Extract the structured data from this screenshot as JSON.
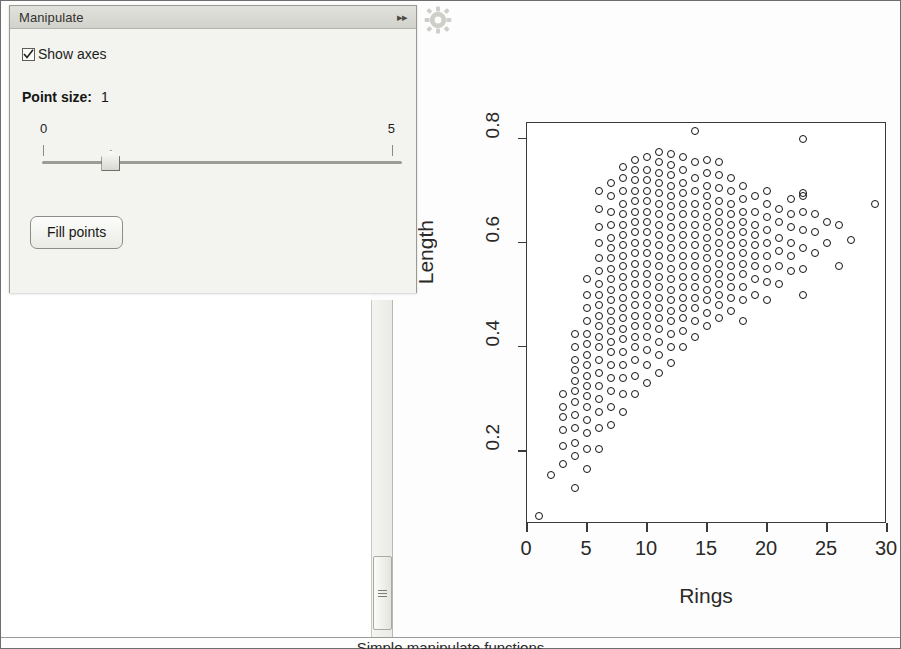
{
  "panel": {
    "title": "Manipulate",
    "collapse_icon": "chevron-double-right-icon",
    "checkbox": {
      "label": "Show axes",
      "checked": true
    },
    "point_size": {
      "label": "Point size:",
      "value": "1"
    },
    "slider": {
      "min_label": "0",
      "max_label": "5",
      "value": 0.95,
      "min": 0,
      "max": 5
    },
    "button": {
      "label": "Fill points"
    }
  },
  "toolbar": {
    "settings_icon": "gear-icon"
  },
  "scrollbar": {
    "name": "vertical-scrollbar",
    "thumb": "scrollbar-thumb"
  },
  "caption": {
    "text": "Simple manipulate functions"
  },
  "chart_data": {
    "type": "scatter",
    "title": "",
    "xlabel": "Rings",
    "ylabel": "Length",
    "xlim": [
      0,
      30
    ],
    "ylim": [
      0.06,
      0.83
    ],
    "xticks": [
      0,
      5,
      10,
      15,
      20,
      25,
      30
    ],
    "yticks": [
      0.2,
      0.4,
      0.6,
      0.8
    ],
    "grid": false,
    "legend": null,
    "marker": "open-circle",
    "marker_color": "#111111",
    "point_count_note": "abalone rings vs length",
    "points": [
      [
        1,
        0.075
      ],
      [
        2,
        0.155
      ],
      [
        3,
        0.175
      ],
      [
        3,
        0.21
      ],
      [
        3,
        0.24
      ],
      [
        3,
        0.265
      ],
      [
        3,
        0.285
      ],
      [
        3,
        0.31
      ],
      [
        4,
        0.13
      ],
      [
        4,
        0.19
      ],
      [
        4,
        0.215
      ],
      [
        4,
        0.245
      ],
      [
        4,
        0.27
      ],
      [
        4,
        0.295
      ],
      [
        4,
        0.315
      ],
      [
        4,
        0.335
      ],
      [
        4,
        0.355
      ],
      [
        4,
        0.375
      ],
      [
        4,
        0.4
      ],
      [
        4,
        0.425
      ],
      [
        5,
        0.165
      ],
      [
        5,
        0.205
      ],
      [
        5,
        0.235
      ],
      [
        5,
        0.26
      ],
      [
        5,
        0.285
      ],
      [
        5,
        0.305
      ],
      [
        5,
        0.325
      ],
      [
        5,
        0.345
      ],
      [
        5,
        0.365
      ],
      [
        5,
        0.385
      ],
      [
        5,
        0.405
      ],
      [
        5,
        0.425
      ],
      [
        5,
        0.45
      ],
      [
        5,
        0.475
      ],
      [
        5,
        0.5
      ],
      [
        5,
        0.53
      ],
      [
        6,
        0.205
      ],
      [
        6,
        0.245
      ],
      [
        6,
        0.275
      ],
      [
        6,
        0.3
      ],
      [
        6,
        0.325
      ],
      [
        6,
        0.35
      ],
      [
        6,
        0.375
      ],
      [
        6,
        0.4
      ],
      [
        6,
        0.42
      ],
      [
        6,
        0.44
      ],
      [
        6,
        0.46
      ],
      [
        6,
        0.48
      ],
      [
        6,
        0.5
      ],
      [
        6,
        0.52
      ],
      [
        6,
        0.545
      ],
      [
        6,
        0.57
      ],
      [
        6,
        0.6
      ],
      [
        6,
        0.63
      ],
      [
        6,
        0.665
      ],
      [
        6,
        0.7
      ],
      [
        7,
        0.25
      ],
      [
        7,
        0.285
      ],
      [
        7,
        0.315
      ],
      [
        7,
        0.34
      ],
      [
        7,
        0.365
      ],
      [
        7,
        0.39
      ],
      [
        7,
        0.41
      ],
      [
        7,
        0.43
      ],
      [
        7,
        0.45
      ],
      [
        7,
        0.47
      ],
      [
        7,
        0.49
      ],
      [
        7,
        0.51
      ],
      [
        7,
        0.53
      ],
      [
        7,
        0.55
      ],
      [
        7,
        0.57
      ],
      [
        7,
        0.59
      ],
      [
        7,
        0.61
      ],
      [
        7,
        0.635
      ],
      [
        7,
        0.66
      ],
      [
        7,
        0.69
      ],
      [
        7,
        0.715
      ],
      [
        8,
        0.275
      ],
      [
        8,
        0.31
      ],
      [
        8,
        0.34
      ],
      [
        8,
        0.365
      ],
      [
        8,
        0.39
      ],
      [
        8,
        0.415
      ],
      [
        8,
        0.435
      ],
      [
        8,
        0.455
      ],
      [
        8,
        0.475
      ],
      [
        8,
        0.495
      ],
      [
        8,
        0.515
      ],
      [
        8,
        0.535
      ],
      [
        8,
        0.555
      ],
      [
        8,
        0.575
      ],
      [
        8,
        0.595
      ],
      [
        8,
        0.615
      ],
      [
        8,
        0.635
      ],
      [
        8,
        0.655
      ],
      [
        8,
        0.675
      ],
      [
        8,
        0.7
      ],
      [
        8,
        0.725
      ],
      [
        8,
        0.745
      ],
      [
        9,
        0.31
      ],
      [
        9,
        0.345
      ],
      [
        9,
        0.375
      ],
      [
        9,
        0.4
      ],
      [
        9,
        0.42
      ],
      [
        9,
        0.44
      ],
      [
        9,
        0.46
      ],
      [
        9,
        0.48
      ],
      [
        9,
        0.5
      ],
      [
        9,
        0.52
      ],
      [
        9,
        0.54
      ],
      [
        9,
        0.56
      ],
      [
        9,
        0.58
      ],
      [
        9,
        0.6
      ],
      [
        9,
        0.62
      ],
      [
        9,
        0.64
      ],
      [
        9,
        0.66
      ],
      [
        9,
        0.68
      ],
      [
        9,
        0.7
      ],
      [
        9,
        0.72
      ],
      [
        9,
        0.74
      ],
      [
        9,
        0.76
      ],
      [
        10,
        0.33
      ],
      [
        10,
        0.365
      ],
      [
        10,
        0.395
      ],
      [
        10,
        0.42
      ],
      [
        10,
        0.44
      ],
      [
        10,
        0.46
      ],
      [
        10,
        0.48
      ],
      [
        10,
        0.5
      ],
      [
        10,
        0.52
      ],
      [
        10,
        0.54
      ],
      [
        10,
        0.56
      ],
      [
        10,
        0.58
      ],
      [
        10,
        0.6
      ],
      [
        10,
        0.62
      ],
      [
        10,
        0.64
      ],
      [
        10,
        0.66
      ],
      [
        10,
        0.68
      ],
      [
        10,
        0.7
      ],
      [
        10,
        0.72
      ],
      [
        10,
        0.74
      ],
      [
        10,
        0.765
      ],
      [
        11,
        0.35
      ],
      [
        11,
        0.385
      ],
      [
        11,
        0.41
      ],
      [
        11,
        0.435
      ],
      [
        11,
        0.455
      ],
      [
        11,
        0.475
      ],
      [
        11,
        0.495
      ],
      [
        11,
        0.515
      ],
      [
        11,
        0.535
      ],
      [
        11,
        0.555
      ],
      [
        11,
        0.575
      ],
      [
        11,
        0.595
      ],
      [
        11,
        0.615
      ],
      [
        11,
        0.635
      ],
      [
        11,
        0.655
      ],
      [
        11,
        0.675
      ],
      [
        11,
        0.695
      ],
      [
        11,
        0.715
      ],
      [
        11,
        0.735
      ],
      [
        11,
        0.755
      ],
      [
        11,
        0.775
      ],
      [
        12,
        0.37
      ],
      [
        12,
        0.4
      ],
      [
        12,
        0.425
      ],
      [
        12,
        0.45
      ],
      [
        12,
        0.47
      ],
      [
        12,
        0.49
      ],
      [
        12,
        0.51
      ],
      [
        12,
        0.53
      ],
      [
        12,
        0.55
      ],
      [
        12,
        0.57
      ],
      [
        12,
        0.59
      ],
      [
        12,
        0.61
      ],
      [
        12,
        0.63
      ],
      [
        12,
        0.65
      ],
      [
        12,
        0.67
      ],
      [
        12,
        0.69
      ],
      [
        12,
        0.71
      ],
      [
        12,
        0.73
      ],
      [
        12,
        0.75
      ],
      [
        12,
        0.77
      ],
      [
        13,
        0.4
      ],
      [
        13,
        0.43
      ],
      [
        13,
        0.455
      ],
      [
        13,
        0.475
      ],
      [
        13,
        0.495
      ],
      [
        13,
        0.515
      ],
      [
        13,
        0.535
      ],
      [
        13,
        0.555
      ],
      [
        13,
        0.575
      ],
      [
        13,
        0.595
      ],
      [
        13,
        0.615
      ],
      [
        13,
        0.635
      ],
      [
        13,
        0.655
      ],
      [
        13,
        0.675
      ],
      [
        13,
        0.695
      ],
      [
        13,
        0.715
      ],
      [
        13,
        0.74
      ],
      [
        13,
        0.765
      ],
      [
        14,
        0.42
      ],
      [
        14,
        0.45
      ],
      [
        14,
        0.475
      ],
      [
        14,
        0.495
      ],
      [
        14,
        0.515
      ],
      [
        14,
        0.535
      ],
      [
        14,
        0.555
      ],
      [
        14,
        0.575
      ],
      [
        14,
        0.595
      ],
      [
        14,
        0.615
      ],
      [
        14,
        0.635
      ],
      [
        14,
        0.655
      ],
      [
        14,
        0.675
      ],
      [
        14,
        0.7
      ],
      [
        14,
        0.725
      ],
      [
        14,
        0.755
      ],
      [
        14,
        0.815
      ],
      [
        15,
        0.44
      ],
      [
        15,
        0.465
      ],
      [
        15,
        0.49
      ],
      [
        15,
        0.51
      ],
      [
        15,
        0.53
      ],
      [
        15,
        0.55
      ],
      [
        15,
        0.57
      ],
      [
        15,
        0.59
      ],
      [
        15,
        0.61
      ],
      [
        15,
        0.63
      ],
      [
        15,
        0.65
      ],
      [
        15,
        0.67
      ],
      [
        15,
        0.69
      ],
      [
        15,
        0.71
      ],
      [
        15,
        0.735
      ],
      [
        15,
        0.76
      ],
      [
        16,
        0.455
      ],
      [
        16,
        0.48
      ],
      [
        16,
        0.5
      ],
      [
        16,
        0.52
      ],
      [
        16,
        0.54
      ],
      [
        16,
        0.56
      ],
      [
        16,
        0.58
      ],
      [
        16,
        0.6
      ],
      [
        16,
        0.62
      ],
      [
        16,
        0.64
      ],
      [
        16,
        0.66
      ],
      [
        16,
        0.68
      ],
      [
        16,
        0.705
      ],
      [
        16,
        0.73
      ],
      [
        16,
        0.755
      ],
      [
        17,
        0.47
      ],
      [
        17,
        0.495
      ],
      [
        17,
        0.515
      ],
      [
        17,
        0.535
      ],
      [
        17,
        0.555
      ],
      [
        17,
        0.575
      ],
      [
        17,
        0.595
      ],
      [
        17,
        0.615
      ],
      [
        17,
        0.635
      ],
      [
        17,
        0.655
      ],
      [
        17,
        0.675
      ],
      [
        17,
        0.7
      ],
      [
        17,
        0.725
      ],
      [
        18,
        0.45
      ],
      [
        18,
        0.49
      ],
      [
        18,
        0.515
      ],
      [
        18,
        0.54
      ],
      [
        18,
        0.56
      ],
      [
        18,
        0.58
      ],
      [
        18,
        0.6
      ],
      [
        18,
        0.62
      ],
      [
        18,
        0.64
      ],
      [
        18,
        0.66
      ],
      [
        18,
        0.685
      ],
      [
        18,
        0.71
      ],
      [
        19,
        0.5
      ],
      [
        19,
        0.53
      ],
      [
        19,
        0.555
      ],
      [
        19,
        0.575
      ],
      [
        19,
        0.595
      ],
      [
        19,
        0.615
      ],
      [
        19,
        0.635
      ],
      [
        19,
        0.66
      ],
      [
        19,
        0.69
      ],
      [
        20,
        0.49
      ],
      [
        20,
        0.525
      ],
      [
        20,
        0.55
      ],
      [
        20,
        0.575
      ],
      [
        20,
        0.6
      ],
      [
        20,
        0.625
      ],
      [
        20,
        0.65
      ],
      [
        20,
        0.675
      ],
      [
        20,
        0.7
      ],
      [
        21,
        0.52
      ],
      [
        21,
        0.555
      ],
      [
        21,
        0.585
      ],
      [
        21,
        0.61
      ],
      [
        21,
        0.64
      ],
      [
        21,
        0.665
      ],
      [
        22,
        0.545
      ],
      [
        22,
        0.575
      ],
      [
        22,
        0.6
      ],
      [
        22,
        0.63
      ],
      [
        22,
        0.655
      ],
      [
        22,
        0.685
      ],
      [
        23,
        0.5
      ],
      [
        23,
        0.55
      ],
      [
        23,
        0.59
      ],
      [
        23,
        0.625
      ],
      [
        23,
        0.66
      ],
      [
        23,
        0.69
      ],
      [
        23,
        0.695
      ],
      [
        23,
        0.8
      ],
      [
        24,
        0.58
      ],
      [
        24,
        0.62
      ],
      [
        24,
        0.655
      ],
      [
        25,
        0.6
      ],
      [
        25,
        0.64
      ],
      [
        26,
        0.555
      ],
      [
        26,
        0.635
      ],
      [
        27,
        0.605
      ],
      [
        29,
        0.675
      ]
    ]
  }
}
